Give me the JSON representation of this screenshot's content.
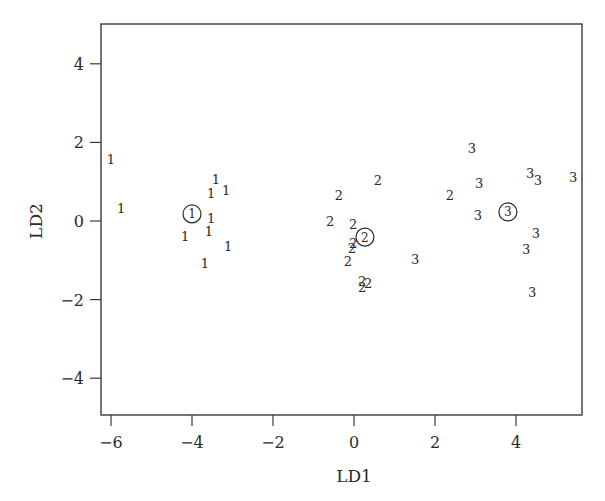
{
  "chart_data": {
    "type": "scatter",
    "title": "",
    "xlabel": "LD1",
    "ylabel": "LD2",
    "xlim": [
      -6.25,
      5.6
    ],
    "ylim": [
      -4.97,
      5.0
    ],
    "xticks": [
      -6,
      -4,
      -2,
      0,
      2,
      4
    ],
    "yticks": [
      -4,
      -2,
      0,
      2,
      4
    ],
    "grid": false,
    "legend": null,
    "marker_style": "points drawn as group-number text labels; group centroids drawn as circled numbers",
    "series": [
      {
        "name": "1",
        "points": [
          {
            "x": -6.0,
            "y": 1.58
          },
          {
            "x": -5.75,
            "y": 0.33
          },
          {
            "x": -3.41,
            "y": 1.07
          },
          {
            "x": -3.53,
            "y": 0.71
          },
          {
            "x": -3.16,
            "y": 0.79
          },
          {
            "x": -3.53,
            "y": 0.08
          },
          {
            "x": -4.17,
            "y": -0.38
          },
          {
            "x": -3.58,
            "y": -0.25
          },
          {
            "x": -3.11,
            "y": -0.64
          },
          {
            "x": -3.68,
            "y": -1.07
          }
        ],
        "centroid": {
          "x": -4.0,
          "y": 0.18
        }
      },
      {
        "name": "2",
        "points": [
          {
            "x": 0.59,
            "y": 1.04
          },
          {
            "x": -0.37,
            "y": 0.66
          },
          {
            "x": -0.59,
            "y": 0.0
          },
          {
            "x": -0.02,
            "y": -0.08
          },
          {
            "x": -0.02,
            "y": -0.56
          },
          {
            "x": -0.05,
            "y": -0.69
          },
          {
            "x": -0.15,
            "y": -1.02
          },
          {
            "x": 0.2,
            "y": -1.53
          },
          {
            "x": 0.35,
            "y": -1.58
          },
          {
            "x": 0.2,
            "y": -1.68
          },
          {
            "x": 2.37,
            "y": 0.66
          }
        ],
        "centroid": {
          "x": 0.27,
          "y": -0.41
        }
      },
      {
        "name": "3",
        "points": [
          {
            "x": 2.91,
            "y": 1.86
          },
          {
            "x": 3.09,
            "y": 0.97
          },
          {
            "x": 4.35,
            "y": 1.22
          },
          {
            "x": 4.54,
            "y": 1.04
          },
          {
            "x": 5.41,
            "y": 1.12
          },
          {
            "x": 3.06,
            "y": 0.15
          },
          {
            "x": 4.49,
            "y": -0.31
          },
          {
            "x": 4.25,
            "y": -0.71
          },
          {
            "x": 4.4,
            "y": -1.81
          },
          {
            "x": 1.51,
            "y": -0.97
          }
        ],
        "centroid": {
          "x": 3.8,
          "y": 0.23
        }
      }
    ]
  },
  "colors": {
    "ink": "#2a2a2a",
    "background": "#ffffff"
  }
}
